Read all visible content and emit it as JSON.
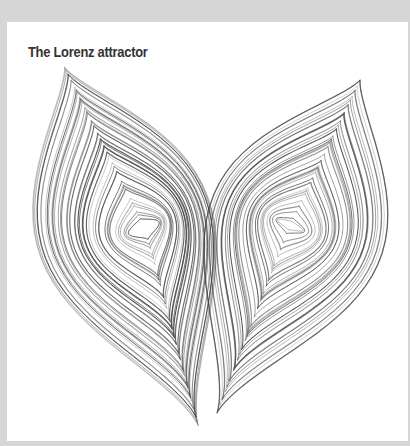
{
  "figure": {
    "title": "The Lorenz attractor",
    "background_color": "#d6d6d6",
    "panel_color": "#ffffff",
    "title_color": "#333333",
    "stroke_color": "#3a3a3a"
  },
  "attractor": {
    "description": "Butterfly-shaped trajectory of the Lorenz system, drawn as two interleaved spiral lobes",
    "left_lobe": {
      "eye_center": [
        145,
        228
      ],
      "top_point": [
        62,
        62
      ],
      "bottom_point": [
        200,
        432
      ],
      "loops": 44
    },
    "right_lobe": {
      "eye_center": [
        290,
        225
      ],
      "top_point": [
        362,
        76
      ],
      "bottom_point": [
        215,
        418
      ],
      "loops": 40
    }
  }
}
